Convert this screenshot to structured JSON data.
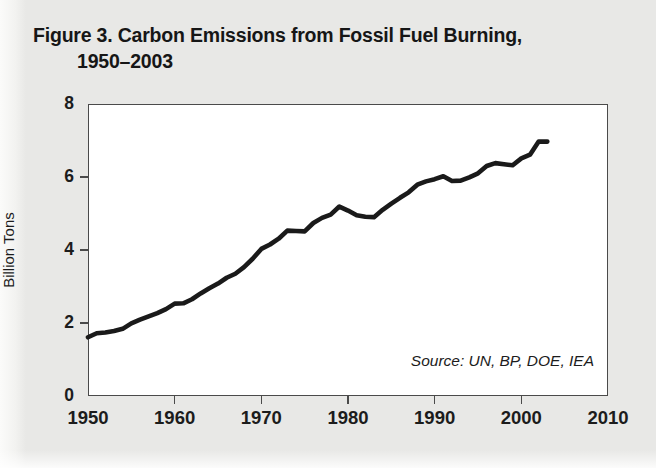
{
  "figure": {
    "title_line_1": "Figure 3. Carbon Emissions from Fossil Fuel Burning,",
    "title_line_2": "1950–2003",
    "source_note": "Source: UN, BP, DOE, IEA",
    "background_color": "#e8e8e6",
    "plot_background_color": "#ffffff",
    "line_color": "#1a1a1a",
    "axis_color": "#4a4a4a"
  },
  "chart_data": {
    "type": "line",
    "title": "Figure 3. Carbon Emissions from Fossil Fuel Burning, 1950–2003",
    "xlabel": "",
    "ylabel": "Billion Tons",
    "xlim": [
      1950,
      2010
    ],
    "ylim": [
      0,
      8
    ],
    "xticks": [
      1950,
      1960,
      1970,
      1980,
      1990,
      2000,
      2010
    ],
    "xtick_labels": [
      "1950",
      "1960",
      "1970",
      "1980",
      "1990",
      "2000",
      "2010"
    ],
    "yticks": [
      0,
      2,
      4,
      6,
      8
    ],
    "ytick_labels": [
      "0",
      "2",
      "4",
      "6",
      "8"
    ],
    "grid": false,
    "legend": false,
    "annotations": [
      "Source: UN, BP, DOE, IEA"
    ],
    "series": [
      {
        "name": "Carbon emissions from fossil fuel burning",
        "units": "billion tons",
        "x": [
          1950,
          1951,
          1952,
          1953,
          1954,
          1955,
          1956,
          1957,
          1958,
          1959,
          1960,
          1961,
          1962,
          1963,
          1964,
          1965,
          1966,
          1967,
          1968,
          1969,
          1970,
          1971,
          1972,
          1973,
          1974,
          1975,
          1976,
          1977,
          1978,
          1979,
          1980,
          1981,
          1982,
          1983,
          1984,
          1985,
          1986,
          1987,
          1988,
          1989,
          1990,
          1991,
          1992,
          1993,
          1994,
          1995,
          1996,
          1997,
          1998,
          1999,
          2000,
          2001,
          2002,
          2003
        ],
        "values": [
          1.61,
          1.72,
          1.74,
          1.78,
          1.84,
          1.99,
          2.09,
          2.18,
          2.27,
          2.38,
          2.53,
          2.54,
          2.65,
          2.81,
          2.95,
          3.08,
          3.24,
          3.35,
          3.53,
          3.76,
          4.03,
          4.15,
          4.31,
          4.53,
          4.52,
          4.51,
          4.74,
          4.88,
          4.97,
          5.19,
          5.08,
          4.95,
          4.91,
          4.9,
          5.1,
          5.27,
          5.43,
          5.58,
          5.79,
          5.88,
          5.94,
          6.02,
          5.89,
          5.9,
          5.99,
          6.1,
          6.3,
          6.38,
          6.35,
          6.32,
          6.51,
          6.61,
          6.97,
          6.97
        ]
      }
    ]
  },
  "axis": {
    "y_title": "Billion Tons"
  }
}
